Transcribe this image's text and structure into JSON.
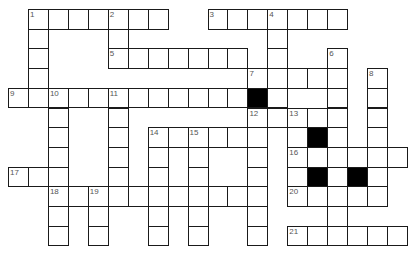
{
  "puzzle": {
    "type": "crossword",
    "origin": {
      "x": 8,
      "y": 9
    },
    "cell_size": {
      "w": 19.95,
      "h": 19.7
    },
    "colors": {
      "line": "#1a1a1a",
      "block": "#000000",
      "number": "#555555",
      "fill": "#ffffff"
    },
    "cells": [
      {
        "r": 0,
        "c": 1,
        "n": "1"
      },
      {
        "r": 0,
        "c": 2
      },
      {
        "r": 0,
        "c": 3
      },
      {
        "r": 0,
        "c": 4
      },
      {
        "r": 0,
        "c": 5,
        "n": "2"
      },
      {
        "r": 0,
        "c": 6
      },
      {
        "r": 0,
        "c": 7
      },
      {
        "r": 0,
        "c": 10,
        "n": "3"
      },
      {
        "r": 0,
        "c": 11
      },
      {
        "r": 0,
        "c": 12
      },
      {
        "r": 0,
        "c": 13,
        "n": "4"
      },
      {
        "r": 0,
        "c": 14
      },
      {
        "r": 0,
        "c": 15
      },
      {
        "r": 0,
        "c": 16
      },
      {
        "r": 1,
        "c": 1
      },
      {
        "r": 1,
        "c": 5
      },
      {
        "r": 1,
        "c": 13
      },
      {
        "r": 2,
        "c": 1
      },
      {
        "r": 2,
        "c": 5,
        "n": "5"
      },
      {
        "r": 2,
        "c": 6
      },
      {
        "r": 2,
        "c": 7
      },
      {
        "r": 2,
        "c": 8
      },
      {
        "r": 2,
        "c": 9
      },
      {
        "r": 2,
        "c": 10
      },
      {
        "r": 2,
        "c": 11
      },
      {
        "r": 2,
        "c": 13
      },
      {
        "r": 2,
        "c": 16,
        "n": "6"
      },
      {
        "r": 3,
        "c": 1
      },
      {
        "r": 3,
        "c": 12,
        "n": "7"
      },
      {
        "r": 3,
        "c": 13
      },
      {
        "r": 3,
        "c": 14
      },
      {
        "r": 3,
        "c": 15
      },
      {
        "r": 3,
        "c": 16
      },
      {
        "r": 3,
        "c": 18,
        "n": "8"
      },
      {
        "r": 4,
        "c": 0,
        "n": "9"
      },
      {
        "r": 4,
        "c": 1
      },
      {
        "r": 4,
        "c": 2,
        "n": "10"
      },
      {
        "r": 4,
        "c": 3
      },
      {
        "r": 4,
        "c": 4
      },
      {
        "r": 4,
        "c": 5,
        "n": "11"
      },
      {
        "r": 4,
        "c": 6
      },
      {
        "r": 4,
        "c": 7
      },
      {
        "r": 4,
        "c": 8
      },
      {
        "r": 4,
        "c": 9
      },
      {
        "r": 4,
        "c": 10
      },
      {
        "r": 4,
        "c": 11
      },
      {
        "r": 4,
        "c": 12,
        "black": true
      },
      {
        "r": 4,
        "c": 13
      },
      {
        "r": 4,
        "c": 16
      },
      {
        "r": 4,
        "c": 18
      },
      {
        "r": 5,
        "c": 2
      },
      {
        "r": 5,
        "c": 5
      },
      {
        "r": 5,
        "c": 12,
        "n": "12"
      },
      {
        "r": 5,
        "c": 13
      },
      {
        "r": 5,
        "c": 14,
        "n": "13"
      },
      {
        "r": 5,
        "c": 15
      },
      {
        "r": 5,
        "c": 16
      },
      {
        "r": 5,
        "c": 18
      },
      {
        "r": 6,
        "c": 2
      },
      {
        "r": 6,
        "c": 5
      },
      {
        "r": 6,
        "c": 7,
        "n": "14"
      },
      {
        "r": 6,
        "c": 8
      },
      {
        "r": 6,
        "c": 9,
        "n": "15"
      },
      {
        "r": 6,
        "c": 10
      },
      {
        "r": 6,
        "c": 11
      },
      {
        "r": 6,
        "c": 12
      },
      {
        "r": 6,
        "c": 14
      },
      {
        "r": 6,
        "c": 15,
        "black": true
      },
      {
        "r": 6,
        "c": 16
      },
      {
        "r": 6,
        "c": 18
      },
      {
        "r": 7,
        "c": 2
      },
      {
        "r": 7,
        "c": 5
      },
      {
        "r": 7,
        "c": 7
      },
      {
        "r": 7,
        "c": 9
      },
      {
        "r": 7,
        "c": 12
      },
      {
        "r": 7,
        "c": 14,
        "n": "16"
      },
      {
        "r": 7,
        "c": 15
      },
      {
        "r": 7,
        "c": 16
      },
      {
        "r": 7,
        "c": 17
      },
      {
        "r": 7,
        "c": 18
      },
      {
        "r": 7,
        "c": 19
      },
      {
        "r": 8,
        "c": 0,
        "n": "17"
      },
      {
        "r": 8,
        "c": 1
      },
      {
        "r": 8,
        "c": 2
      },
      {
        "r": 8,
        "c": 5
      },
      {
        "r": 8,
        "c": 7
      },
      {
        "r": 8,
        "c": 9
      },
      {
        "r": 8,
        "c": 12
      },
      {
        "r": 8,
        "c": 14
      },
      {
        "r": 8,
        "c": 15,
        "black": true
      },
      {
        "r": 8,
        "c": 16
      },
      {
        "r": 8,
        "c": 17,
        "black": true
      },
      {
        "r": 8,
        "c": 18
      },
      {
        "r": 9,
        "c": 2,
        "n": "18"
      },
      {
        "r": 9,
        "c": 3
      },
      {
        "r": 9,
        "c": 4,
        "n": "19"
      },
      {
        "r": 9,
        "c": 5
      },
      {
        "r": 9,
        "c": 6
      },
      {
        "r": 9,
        "c": 7
      },
      {
        "r": 9,
        "c": 8
      },
      {
        "r": 9,
        "c": 9
      },
      {
        "r": 9,
        "c": 10
      },
      {
        "r": 9,
        "c": 11
      },
      {
        "r": 9,
        "c": 12
      },
      {
        "r": 9,
        "c": 14,
        "n": "20"
      },
      {
        "r": 9,
        "c": 15
      },
      {
        "r": 9,
        "c": 16
      },
      {
        "r": 9,
        "c": 17
      },
      {
        "r": 9,
        "c": 18
      },
      {
        "r": 10,
        "c": 2
      },
      {
        "r": 10,
        "c": 4
      },
      {
        "r": 10,
        "c": 7
      },
      {
        "r": 10,
        "c": 9
      },
      {
        "r": 10,
        "c": 12
      },
      {
        "r": 10,
        "c": 16
      },
      {
        "r": 11,
        "c": 2
      },
      {
        "r": 11,
        "c": 4
      },
      {
        "r": 11,
        "c": 7
      },
      {
        "r": 11,
        "c": 9
      },
      {
        "r": 11,
        "c": 12
      },
      {
        "r": 11,
        "c": 14,
        "n": "21"
      },
      {
        "r": 11,
        "c": 15
      },
      {
        "r": 11,
        "c": 16
      },
      {
        "r": 11,
        "c": 17
      },
      {
        "r": 11,
        "c": 18
      },
      {
        "r": 11,
        "c": 19
      }
    ],
    "entries": {
      "across": [
        {
          "n": "1",
          "row": 0,
          "col": 1,
          "length": 7
        },
        {
          "n": "3",
          "row": 0,
          "col": 10,
          "length": 7
        },
        {
          "n": "5",
          "row": 2,
          "col": 5,
          "length": 7
        },
        {
          "n": "7",
          "row": 3,
          "col": 12,
          "length": 5
        },
        {
          "n": "9",
          "row": 4,
          "col": 0,
          "length": 12
        },
        {
          "n": "12",
          "row": 5,
          "col": 12,
          "length": 5
        },
        {
          "n": "14",
          "row": 6,
          "col": 7,
          "length": 6
        },
        {
          "n": "16",
          "row": 7,
          "col": 14,
          "length": 6
        },
        {
          "n": "17",
          "row": 8,
          "col": 0,
          "length": 3
        },
        {
          "n": "18",
          "row": 9,
          "col": 2,
          "length": 11
        },
        {
          "n": "20",
          "row": 9,
          "col": 14,
          "length": 5
        },
        {
          "n": "21",
          "row": 11,
          "col": 14,
          "length": 6
        }
      ],
      "down": [
        {
          "n": "1",
          "row": 0,
          "col": 1,
          "length": 5
        },
        {
          "n": "2",
          "row": 0,
          "col": 5,
          "length": 3
        },
        {
          "n": "4",
          "row": 0,
          "col": 13,
          "length": 6
        },
        {
          "n": "6",
          "row": 2,
          "col": 16,
          "length": 10
        },
        {
          "n": "8",
          "row": 3,
          "col": 18,
          "length": 7
        },
        {
          "n": "10",
          "row": 4,
          "col": 2,
          "length": 8
        },
        {
          "n": "11",
          "row": 4,
          "col": 5,
          "length": 6
        },
        {
          "n": "12",
          "row": 5,
          "col": 12,
          "length": 7
        },
        {
          "n": "13",
          "row": 5,
          "col": 14,
          "length": 5
        },
        {
          "n": "14",
          "row": 6,
          "col": 7,
          "length": 6
        },
        {
          "n": "15",
          "row": 6,
          "col": 9,
          "length": 6
        },
        {
          "n": "19",
          "row": 9,
          "col": 4,
          "length": 3
        }
      ]
    }
  }
}
